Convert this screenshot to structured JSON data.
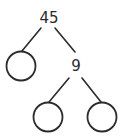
{
  "diagram": {
    "type": "factor-tree",
    "root": {
      "label": "45"
    },
    "nodes": [
      {
        "id": "root",
        "label": "45",
        "kind": "text"
      },
      {
        "id": "left-child",
        "label": "",
        "kind": "empty-circle"
      },
      {
        "id": "right-child",
        "label": "9",
        "kind": "text"
      },
      {
        "id": "grandchild-left",
        "label": "",
        "kind": "empty-circle"
      },
      {
        "id": "grandchild-right",
        "label": "",
        "kind": "empty-circle"
      }
    ],
    "edges": [
      {
        "from": "root",
        "to": "left-child"
      },
      {
        "from": "root",
        "to": "right-child"
      },
      {
        "from": "right-child",
        "to": "grandchild-left"
      },
      {
        "from": "right-child",
        "to": "grandchild-right"
      }
    ],
    "colors": {
      "stroke": "#2b2b2b",
      "background": "#ffffff"
    }
  }
}
